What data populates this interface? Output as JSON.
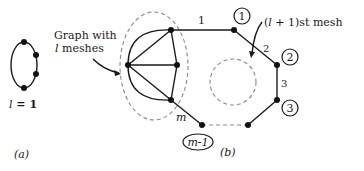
{
  "panel_a": {
    "label": "(a)",
    "caption_var": "l",
    "caption_rest": " = 1"
  },
  "panel_b": {
    "label": "(b)",
    "graph_label_line1": "Graph with",
    "graph_label_var": "l",
    "graph_label_line2_rest": " meshes",
    "mesh_label_pre": "(",
    "mesh_label_var": "l",
    "mesh_label_post": " + 1)st mesh",
    "edge_labels": [
      "1",
      "2",
      "3",
      "m"
    ],
    "node_labels": [
      "1",
      "2",
      "3",
      "m-1"
    ]
  },
  "colors": {
    "ink": "#1a1a1a",
    "dashed": "#8a8a8a",
    "background": "#ffffff"
  }
}
